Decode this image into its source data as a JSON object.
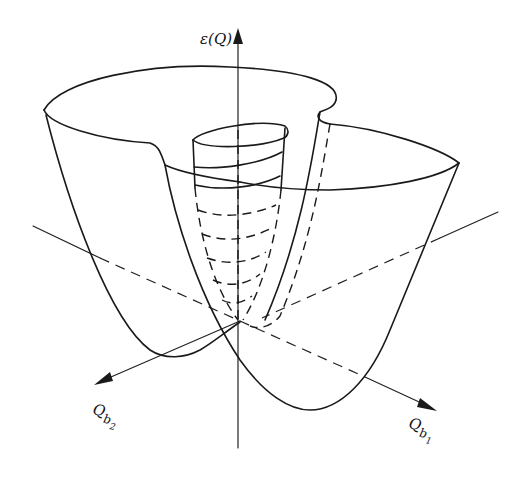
{
  "figure": {
    "axes": {
      "vertical": {
        "symbol": "ε",
        "argument": "(Q)",
        "label": "ε(Q)"
      },
      "axis1": {
        "base": "Q",
        "sub": "b",
        "subsub": "1",
        "label": "Q_b1"
      },
      "axis2": {
        "base": "Q",
        "sub": "b",
        "subsub": "2",
        "label": "Q_b2"
      }
    },
    "colors": {
      "line": "#1a1a1a",
      "background": "#ffffff"
    }
  }
}
